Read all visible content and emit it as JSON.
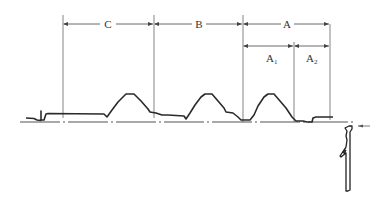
{
  "diagram": {
    "dimensions": {
      "top_row": [
        {
          "label": "C",
          "from_x": 63,
          "to_x": 154
        },
        {
          "label": "B",
          "from_x": 154,
          "to_x": 243
        },
        {
          "label": "A",
          "from_x": 243,
          "to_x": 330
        }
      ],
      "second_row": [
        {
          "label": "A",
          "sub": "1",
          "from_x": 243,
          "to_x": 294
        },
        {
          "label": "A",
          "sub": "2",
          "from_x": 294,
          "to_x": 330
        }
      ]
    },
    "labels": {
      "C": "C",
      "B": "B",
      "A": "A",
      "A1_main": "A",
      "A1_sub": "1",
      "A2_main": "A",
      "A2_sub": "2"
    },
    "colors": {
      "line": "#555555",
      "trace": "#2a2a2a",
      "text": "#333333"
    }
  }
}
